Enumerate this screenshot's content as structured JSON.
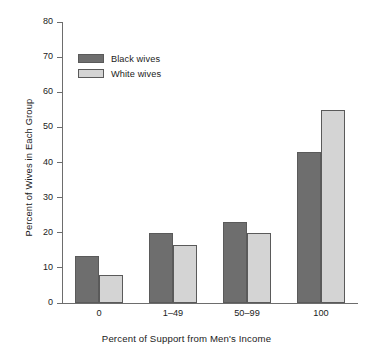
{
  "chart_data": {
    "type": "bar",
    "title": "",
    "subtitle": "",
    "xlabel": "Percent of Support from Men's Income",
    "ylabel": "Percent of Wives in Each Group",
    "categories": [
      "0",
      "1–49",
      "50–99",
      "100"
    ],
    "series": [
      {
        "name": "Black wives",
        "values": [
          13.5,
          20,
          23,
          43
        ],
        "color": "#6e6e6e"
      },
      {
        "name": "White wives",
        "values": [
          8,
          16.5,
          20,
          55
        ],
        "color": "#d4d4d4"
      }
    ],
    "ylim": [
      0,
      80
    ],
    "ytick_step": 10,
    "yticks": [
      0,
      10,
      20,
      30,
      40,
      50,
      60,
      70,
      80
    ],
    "ytick_labels": [
      "0",
      "10",
      "20",
      "30",
      "40",
      "50",
      "60",
      "70",
      "80"
    ],
    "grid": false,
    "legend_position": "upper left",
    "legend_entries": [
      "Black wives",
      "White wives"
    ],
    "annotations": []
  },
  "axes": {
    "y_title": "Percent of Wives in Each Group",
    "x_title": "Percent of Support from Men's Income"
  },
  "colors": {
    "series_black_wives": "#6e6e6e",
    "series_white_wives": "#d4d4d4",
    "axis": "#6d6d6d",
    "bar_outline": "#5a5a5a",
    "text": "#1b1b1b",
    "background": "#ffffff"
  }
}
